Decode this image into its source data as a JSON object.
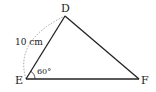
{
  "diagram": {
    "type": "triangle",
    "vertices": {
      "D": {
        "label": "D",
        "x": 65,
        "y": 16
      },
      "E": {
        "label": "E",
        "x": 26,
        "y": 79
      },
      "F": {
        "label": "F",
        "x": 139,
        "y": 79
      }
    },
    "side_DE_label": "10 cm",
    "angle_E_label": "60°",
    "line_color": "#222222",
    "arc_color": "#888888"
  }
}
